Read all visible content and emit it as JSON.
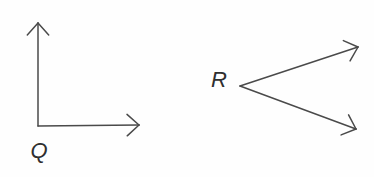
{
  "canvas": {
    "width": 374,
    "height": 177,
    "background": "#fefefe",
    "stroke_color": "#4a4a4a",
    "stroke_width": 1.5,
    "arrowhead_length": 16,
    "arrowhead_half_angle_deg": 42
  },
  "figures": [
    {
      "id": "angle-Q",
      "label": "Q",
      "label_pos": {
        "x": 39,
        "y": 151
      },
      "vertex": {
        "x": 38,
        "y": 126
      },
      "rays": [
        {
          "name": "ray-up",
          "tip": {
            "x": 38,
            "y": 23
          }
        },
        {
          "name": "ray-right",
          "tip": {
            "x": 139,
            "y": 125
          }
        }
      ]
    },
    {
      "id": "angle-R",
      "label": "R",
      "label_pos": {
        "x": 219,
        "y": 80
      },
      "vertex": {
        "x": 240,
        "y": 86
      },
      "rays": [
        {
          "name": "ray-upper-right",
          "tip": {
            "x": 358,
            "y": 47
          }
        },
        {
          "name": "ray-lower-right",
          "tip": {
            "x": 356,
            "y": 129
          }
        }
      ]
    }
  ]
}
